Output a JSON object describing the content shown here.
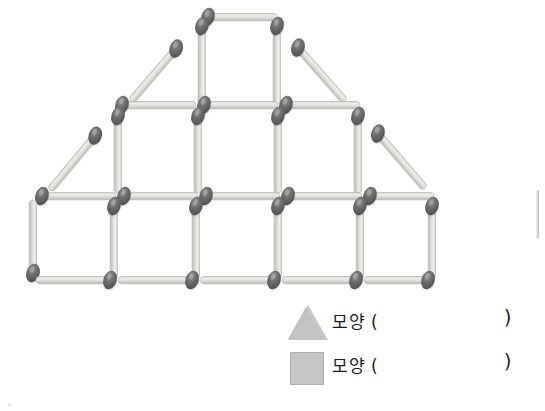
{
  "page": {
    "background": "#ffffff"
  },
  "colors": {
    "match_head": "#6e6e6e",
    "match_head_dark": "#565656",
    "match_stick": "#d8d8d4",
    "match_stick_edge": "#b9b9b4",
    "legend_shape_fill": "#c6c6c6",
    "legend_shape_stroke": "#b0b0b0",
    "text": "#1c1c1c"
  },
  "figure": {
    "name": "matchstick-house-figure",
    "unit_length": 80,
    "rows": [
      {
        "name": "top-row",
        "squares": 1,
        "diagonals": 2
      },
      {
        "name": "middle-row",
        "squares": 3,
        "diagonals": 2
      },
      {
        "name": "bottom-row",
        "squares": 5,
        "diagonals": 0
      }
    ],
    "matches": [
      {
        "id": "t-h-top-1",
        "x1": 202,
        "y1": 17,
        "x2": 277,
        "y2": 17,
        "head": "start"
      },
      {
        "id": "t-v-left-1",
        "x1": 202,
        "y1": 20,
        "x2": 202,
        "y2": 104,
        "head": "start"
      },
      {
        "id": "t-v-right-1",
        "x1": 277,
        "y1": 20,
        "x2": 277,
        "y2": 104,
        "head": "start"
      },
      {
        "id": "t-diag-left",
        "x1": 131,
        "y1": 101,
        "x2": 180,
        "y2": 44,
        "head": "end"
      },
      {
        "id": "t-diag-right",
        "x1": 294,
        "y1": 43,
        "x2": 345,
        "y2": 101,
        "head": "start"
      },
      {
        "id": "m-h-1",
        "x1": 116,
        "y1": 105,
        "x2": 196,
        "y2": 105,
        "head": "start"
      },
      {
        "id": "m-h-2",
        "x1": 198,
        "y1": 105,
        "x2": 278,
        "y2": 105,
        "head": "start"
      },
      {
        "id": "m-h-3",
        "x1": 280,
        "y1": 105,
        "x2": 360,
        "y2": 105,
        "head": "start"
      },
      {
        "id": "m-v-1",
        "x1": 118,
        "y1": 110,
        "x2": 118,
        "y2": 193,
        "head": "start"
      },
      {
        "id": "m-v-2",
        "x1": 198,
        "y1": 110,
        "x2": 198,
        "y2": 193,
        "head": "start"
      },
      {
        "id": "m-v-3",
        "x1": 278,
        "y1": 110,
        "x2": 278,
        "y2": 193,
        "head": "start"
      },
      {
        "id": "m-v-4",
        "x1": 358,
        "y1": 110,
        "x2": 358,
        "y2": 193,
        "head": "start"
      },
      {
        "id": "m-diag-left",
        "x1": 50,
        "y1": 190,
        "x2": 99,
        "y2": 131,
        "head": "end"
      },
      {
        "id": "m-diag-right",
        "x1": 374,
        "y1": 129,
        "x2": 425,
        "y2": 188,
        "head": "start"
      },
      {
        "id": "b-h-top-1",
        "x1": 36,
        "y1": 196,
        "x2": 116,
        "y2": 196,
        "head": "start"
      },
      {
        "id": "b-h-top-2",
        "x1": 118,
        "y1": 196,
        "x2": 198,
        "y2": 196,
        "head": "start"
      },
      {
        "id": "b-h-top-3",
        "x1": 200,
        "y1": 196,
        "x2": 280,
        "y2": 196,
        "head": "start"
      },
      {
        "id": "b-h-top-4",
        "x1": 282,
        "y1": 196,
        "x2": 362,
        "y2": 196,
        "head": "start"
      },
      {
        "id": "b-h-top-5",
        "x1": 364,
        "y1": 196,
        "x2": 434,
        "y2": 196,
        "head": "start"
      },
      {
        "id": "b-v-0",
        "x1": 33,
        "y1": 200,
        "x2": 33,
        "y2": 279,
        "head": "end"
      },
      {
        "id": "b-v-1",
        "x1": 114,
        "y1": 200,
        "x2": 114,
        "y2": 279,
        "head": "start"
      },
      {
        "id": "b-v-2",
        "x1": 196,
        "y1": 200,
        "x2": 196,
        "y2": 279,
        "head": "start"
      },
      {
        "id": "b-v-3",
        "x1": 278,
        "y1": 200,
        "x2": 278,
        "y2": 279,
        "head": "start"
      },
      {
        "id": "b-v-4",
        "x1": 360,
        "y1": 200,
        "x2": 360,
        "y2": 279,
        "head": "start"
      },
      {
        "id": "b-v-5",
        "x1": 432,
        "y1": 200,
        "x2": 432,
        "y2": 279,
        "head": "start"
      },
      {
        "id": "b-h-bot-1",
        "x1": 36,
        "y1": 280,
        "x2": 116,
        "y2": 280,
        "head": "end"
      },
      {
        "id": "b-h-bot-2",
        "x1": 118,
        "y1": 280,
        "x2": 198,
        "y2": 280,
        "head": "end"
      },
      {
        "id": "b-h-bot-3",
        "x1": 200,
        "y1": 280,
        "x2": 280,
        "y2": 280,
        "head": "end"
      },
      {
        "id": "b-h-bot-4",
        "x1": 282,
        "y1": 280,
        "x2": 362,
        "y2": 280,
        "head": "end"
      },
      {
        "id": "b-h-bot-5",
        "x1": 364,
        "y1": 280,
        "x2": 434,
        "y2": 280,
        "head": "end"
      }
    ]
  },
  "legend": {
    "rows": [
      {
        "shape": "triangle",
        "shape_name": "triangle-shape-swatch",
        "label": "모양 (",
        "close": ")",
        "answer": ""
      },
      {
        "shape": "square",
        "shape_name": "square-shape-swatch",
        "label": "모양 (",
        "close": ")",
        "answer": ""
      }
    ]
  }
}
